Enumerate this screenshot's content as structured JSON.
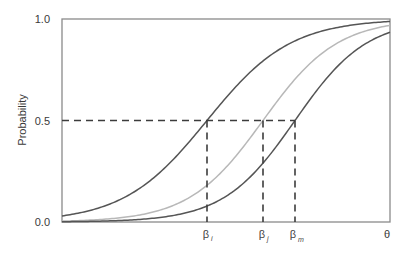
{
  "chart_data": {
    "type": "line",
    "title": "",
    "xlabel": "θ",
    "ylabel": "Probability",
    "ylim": [
      0.0,
      1.0
    ],
    "yticks": [
      "0.0",
      "0.5",
      "1.0"
    ],
    "grid": false,
    "legend": null,
    "x_markers": [
      {
        "symbol": "β",
        "subscript": "i",
        "x": 207
      },
      {
        "symbol": "β",
        "subscript": "j",
        "x": 263
      },
      {
        "symbol": "β",
        "subscript": "m",
        "x": 295
      }
    ],
    "reference_line": {
      "y": 0.5,
      "style": "dashed"
    },
    "series": [
      {
        "name": "item i",
        "shape": "logistic",
        "location": "β_i",
        "color": "#555555",
        "slope": 0.024,
        "center_px": 207
      },
      {
        "name": "item j",
        "shape": "logistic",
        "location": "β_j",
        "color": "#b8b8b8",
        "slope": 0.027,
        "center_px": 263
      },
      {
        "name": "item m",
        "shape": "logistic",
        "location": "β_m",
        "color": "#555555",
        "slope": 0.028,
        "center_px": 295
      }
    ]
  },
  "axis": {
    "y_title": "Probability",
    "y_ticks": [
      "1.0",
      "0.5",
      "0.0"
    ],
    "x_title": "θ",
    "beta_symbol": "β",
    "beta_subs": [
      "i",
      "j",
      "m"
    ]
  },
  "colors": {
    "axis": "#8a8a8a",
    "dark_curve": "#555555",
    "light_curve": "#b8b8b8",
    "dashed": "#3c3c3c",
    "text": "#3a3a3a"
  }
}
